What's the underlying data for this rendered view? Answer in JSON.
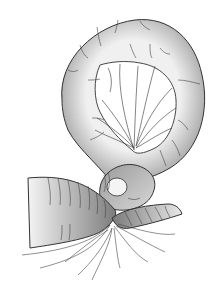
{
  "illustration": {
    "subject": "volvulus-bowel-loop",
    "background": "#ffffff",
    "fill_dark": "#8a8a8a",
    "fill_light": "#f2f2f2",
    "stroke": "#333333"
  }
}
